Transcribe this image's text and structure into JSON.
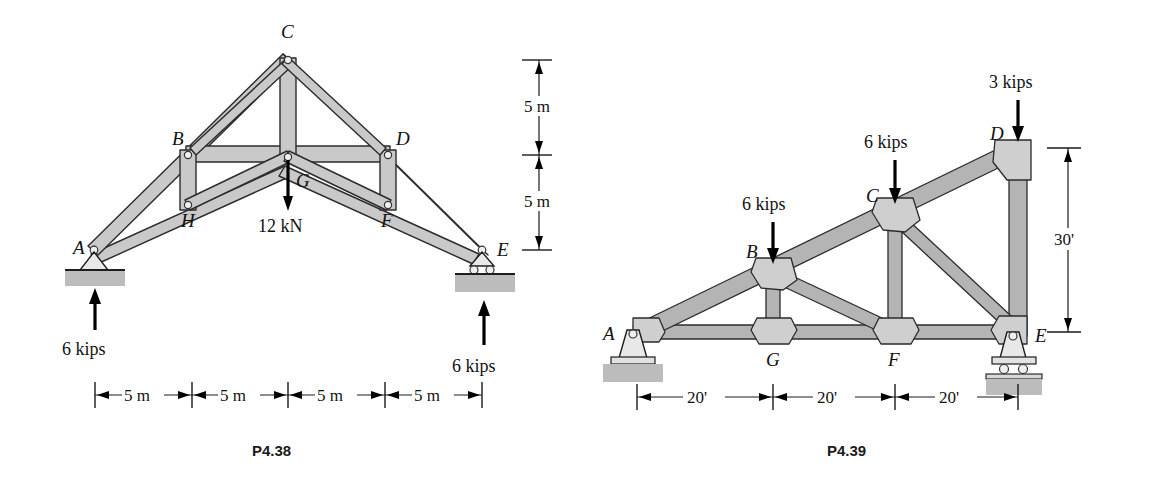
{
  "page": {
    "background": "#ffffff",
    "width": 1151,
    "height": 486
  },
  "figures": [
    {
      "id": "P4.38",
      "caption": "P4.38",
      "description": "Symmetric roof truss with pin support at A and roller support at E",
      "joint_labels": [
        "A",
        "B",
        "C",
        "D",
        "E",
        "F",
        "G",
        "H"
      ],
      "labels": {
        "A": "A",
        "B": "B",
        "C": "C",
        "D": "D",
        "E": "E",
        "F": "F",
        "G": "G",
        "H": "H"
      },
      "loads": [
        {
          "name": "center-load",
          "label": "12 kN",
          "at_joint": "G",
          "direction": "down"
        },
        {
          "name": "reaction-a",
          "label": "6 kips",
          "at_joint": "A",
          "direction": "up"
        },
        {
          "name": "reaction-e",
          "label": "6 kips",
          "at_joint": "E",
          "direction": "up"
        }
      ],
      "horizontal_dimensions": [
        "5 m",
        "5 m",
        "5 m",
        "5 m"
      ],
      "vertical_dimensions": [
        "5 m",
        "5 m"
      ],
      "supports": [
        {
          "joint": "A",
          "type": "pin"
        },
        {
          "joint": "E",
          "type": "roller"
        }
      ]
    },
    {
      "id": "P4.39",
      "caption": "P4.39",
      "description": "Right-triangle truss with inclined top chord, pin at A and roller at E",
      "joint_labels": [
        "A",
        "B",
        "C",
        "D",
        "E",
        "F",
        "G"
      ],
      "labels": {
        "A": "A",
        "B": "B",
        "C": "C",
        "D": "D",
        "E": "E",
        "F": "F",
        "G": "G"
      },
      "loads": [
        {
          "name": "load-b",
          "label": "6 kips",
          "at_joint": "B",
          "direction": "down"
        },
        {
          "name": "load-c",
          "label": "6 kips",
          "at_joint": "C",
          "direction": "down"
        },
        {
          "name": "load-d",
          "label": "3 kips",
          "at_joint": "D",
          "direction": "down"
        }
      ],
      "horizontal_dimensions": [
        "20'",
        "20'",
        "20'"
      ],
      "vertical_dimensions": [
        "30'"
      ],
      "supports": [
        {
          "joint": "A",
          "type": "pin"
        },
        {
          "joint": "E",
          "type": "roller"
        }
      ]
    }
  ],
  "colors": {
    "member_fill": "#c9c9c9",
    "member_stroke": "#2b2b2b",
    "ground": "#bcbcbc",
    "text": "#111111",
    "caption": "#1a1a1a"
  }
}
